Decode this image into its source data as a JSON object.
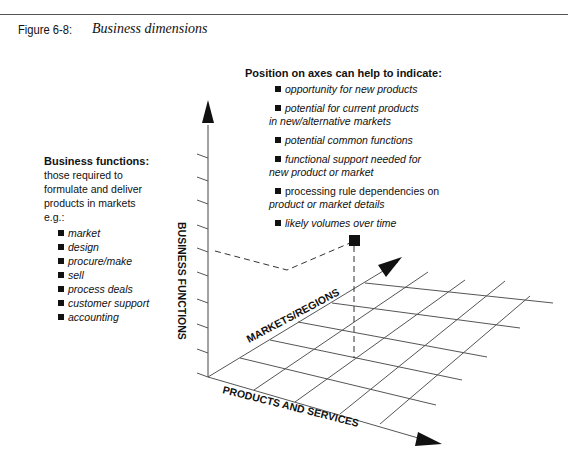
{
  "figure": {
    "label": "Figure 6-8:",
    "title": "Business dimensions"
  },
  "position_block": {
    "heading": "Position on axes can help to indicate:",
    "items": [
      {
        "lines": [
          "opportunity for new products"
        ],
        "italic": true
      },
      {
        "lines": [
          "potential for current products",
          "in new/alternative markets"
        ],
        "italic": true
      },
      {
        "lines": [
          "potential common functions"
        ],
        "italic": true
      },
      {
        "lines": [
          "functional support needed for",
          "new product or market"
        ],
        "italic": true
      },
      {
        "lines": [
          "processing rule dependencies on",
          "product or market details"
        ],
        "italic": false,
        "second_line_italic": true
      },
      {
        "lines": [
          "likely volumes over time"
        ],
        "italic": true
      }
    ]
  },
  "business_functions_block": {
    "heading": "Business functions:",
    "description": [
      "those required to",
      "formulate and deliver",
      "products in markets",
      "e.g.:"
    ],
    "examples": [
      "market",
      "design",
      "procure/make",
      "sell",
      "process deals",
      "customer support",
      "accounting"
    ]
  },
  "axes": {
    "vertical": "BUSINESS FUNCTIONS",
    "depth": "MARKETS/REGIONS",
    "horizontal": "PRODUCTS AND SERVICES"
  },
  "icons": {
    "bullet": "square-bullet-icon",
    "marker": "square-marker-icon",
    "arrow": "arrowhead-icon"
  },
  "colors": {
    "ink": "#111111",
    "grid": "#555555",
    "background": "#ffffff"
  }
}
